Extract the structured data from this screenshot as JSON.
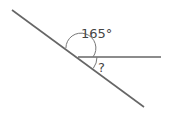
{
  "diagram": {
    "angle_label": "165°",
    "unknown_label": "?",
    "line_color": "#666666"
  }
}
